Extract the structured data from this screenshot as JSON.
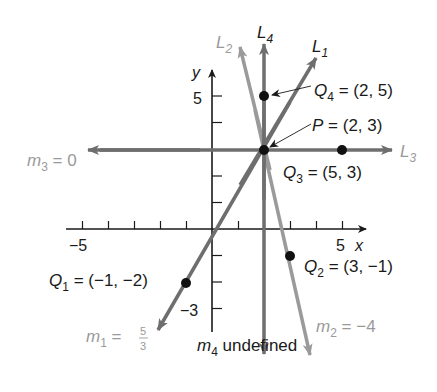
{
  "figure": {
    "axes": {
      "x_label": "x",
      "y_label": "y",
      "x_tick_min_label": "−5",
      "x_tick_max_label": "5",
      "y_tick_max_label": "5",
      "y_tick_min_label": "−3",
      "x_range": [
        -5,
        5
      ],
      "y_range": [
        -3,
        5
      ]
    },
    "lines": [
      {
        "id": "L1",
        "label_main": "L",
        "label_sub": "1",
        "slope_text_main": "m",
        "slope_sub": "1",
        "slope_eq": " = ",
        "slope_num": "5",
        "slope_den": "3",
        "slope": "5/3"
      },
      {
        "id": "L2",
        "label_main": "L",
        "label_sub": "2",
        "slope_text_main": "m",
        "slope_sub": "2",
        "slope_eq": " = −4",
        "slope": "-4"
      },
      {
        "id": "L3",
        "label_main": "L",
        "label_sub": "3",
        "slope_text_main": "m",
        "slope_sub": "3",
        "slope_eq": " = 0",
        "slope": "0"
      },
      {
        "id": "L4",
        "label_main": "L",
        "label_sub": "4",
        "slope_text_main": "m",
        "slope_sub": "4",
        "slope_eq": " undefined",
        "slope": "undefined"
      }
    ],
    "points": [
      {
        "id": "P",
        "label_main": "P",
        "label_sub": "",
        "coords": " = (2, 3)",
        "x": 2,
        "y": 3
      },
      {
        "id": "Q1",
        "label_main": "Q",
        "label_sub": "1",
        "coords": " = (−1, −2)",
        "x": -1,
        "y": -2
      },
      {
        "id": "Q2",
        "label_main": "Q",
        "label_sub": "2",
        "coords": " = (3, −1)",
        "x": 3,
        "y": -1
      },
      {
        "id": "Q3",
        "label_main": "Q",
        "label_sub": "3",
        "coords": " = (5, 3)",
        "x": 5,
        "y": 3
      },
      {
        "id": "Q4",
        "label_main": "Q",
        "label_sub": "4",
        "coords": " = (2, 5)",
        "x": 2,
        "y": 5
      }
    ],
    "colors": {
      "axis": "#1a1a1a",
      "line_dark": "#6e6e6e",
      "line_light": "#9a9a9a",
      "point": "#111111",
      "label_dark": "#1a1a1a",
      "label_light": "#9a9a9a"
    }
  }
}
